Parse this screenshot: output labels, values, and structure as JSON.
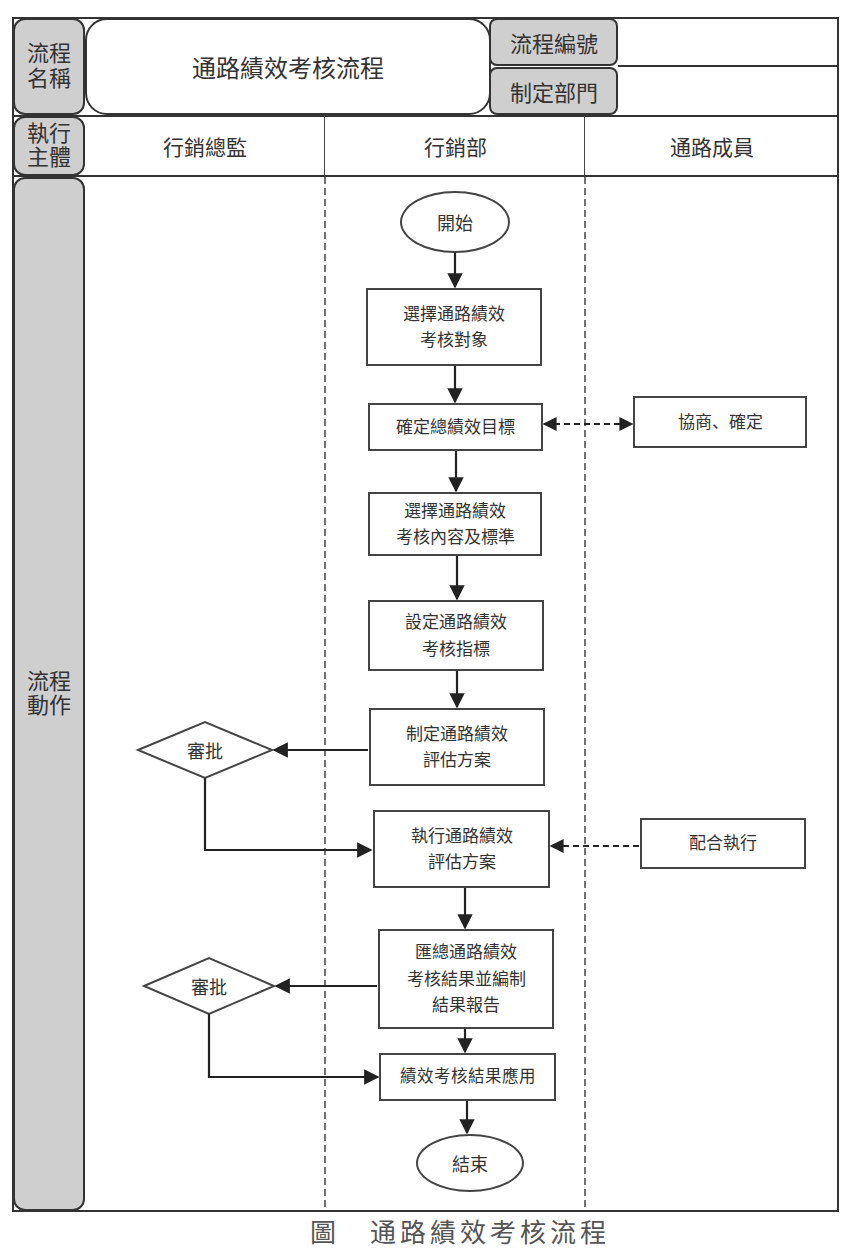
{
  "header": {
    "process_name_label": "流程\n名稱",
    "process_name": "通路績效考核流程",
    "process_number_label": "流程編號",
    "process_number_value": "",
    "department_label": "制定部門",
    "department_value": ""
  },
  "lanes": {
    "row_label": "執行\n主體",
    "items": [
      {
        "label": "行銷總監"
      },
      {
        "label": "行銷部"
      },
      {
        "label": "通路成員"
      }
    ]
  },
  "flow": {
    "row_label": "流程\n動作",
    "start": "開始",
    "end": "結束",
    "steps": [
      {
        "label": "選擇通路績效\n考核對象"
      },
      {
        "label": "確定總績效目標"
      },
      {
        "label": "選擇通路績效\n考核內容及標準"
      },
      {
        "label": "設定通路績效\n考核指標"
      },
      {
        "label": "制定通路績效\n評估方案"
      },
      {
        "label": "執行通路績效\n評估方案"
      },
      {
        "label": "匯總通路績效\n考核結果並編制\n結果報告"
      },
      {
        "label": "績效考核結果應用"
      }
    ],
    "member_steps": [
      {
        "label": "協商、確定"
      },
      {
        "label": "配合執行"
      }
    ],
    "decisions": [
      {
        "label": "審批"
      },
      {
        "label": "審批"
      }
    ]
  },
  "caption": "圖　通路績效考核流程",
  "colors": {
    "line": "#333333",
    "tab_fill": "#cfcfcf",
    "background": "#ffffff"
  }
}
